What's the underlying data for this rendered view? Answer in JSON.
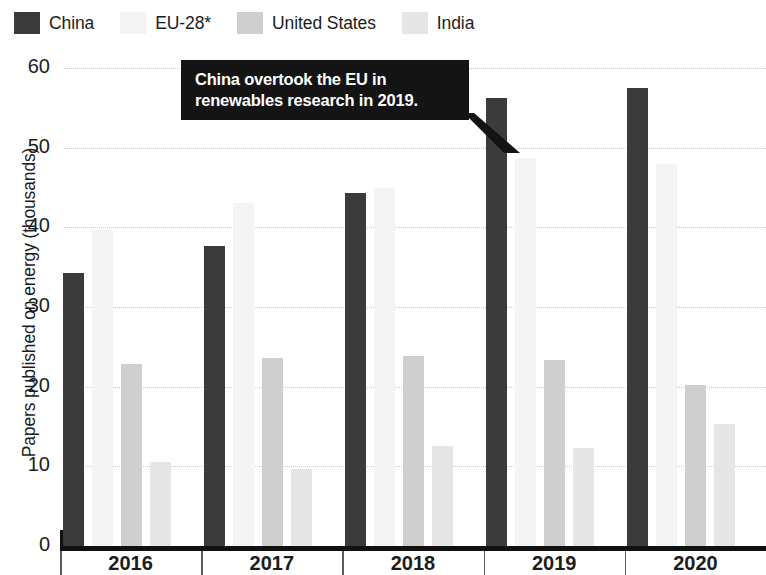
{
  "legend": {
    "entries": [
      {
        "label": "China",
        "color": "#3b3b3b",
        "key": "china"
      },
      {
        "label": "EU-28*",
        "color": "#f4f4f4",
        "key": "eu"
      },
      {
        "label": "United States",
        "color": "#cfcfcf",
        "key": "us"
      },
      {
        "label": "India",
        "color": "#e6e6e6",
        "key": "india"
      }
    ]
  },
  "annotation": {
    "text": "China overtook the EU in\nrenewables research in 2019.",
    "background": "#141414",
    "text_color": "#ffffff"
  },
  "chart_data": {
    "type": "bar",
    "title": "",
    "subtitle": "",
    "xlabel": "",
    "ylabel": "Papers published on energy (thousands)",
    "categories": [
      "2016",
      "2017",
      "2018",
      "2019",
      "2020"
    ],
    "series": [
      {
        "name": "China",
        "color": "#3b3b3b",
        "values": [
          34.3,
          37.6,
          44.3,
          56.2,
          57.5
        ]
      },
      {
        "name": "EU-28*",
        "color": "#f4f4f4",
        "values": [
          39.7,
          43.0,
          45.0,
          48.7,
          48.0
        ]
      },
      {
        "name": "United States",
        "color": "#cfcfcf",
        "values": [
          22.8,
          23.6,
          23.9,
          23.4,
          20.2
        ]
      },
      {
        "name": "India",
        "color": "#e6e6e6",
        "values": [
          10.6,
          9.7,
          12.5,
          12.3,
          15.3
        ]
      }
    ],
    "ylim": [
      0,
      60
    ],
    "yticks": [
      0,
      10,
      20,
      30,
      40,
      50,
      60
    ],
    "ytick_labels": [
      "0",
      "10",
      "20",
      "30",
      "40",
      "50",
      "60"
    ],
    "grid": true,
    "grid_style": "dotted",
    "grid_color": "#c9c9c9",
    "legend_position": "top-left",
    "annotations": [
      {
        "text": "China overtook the EU in renewables research in 2019.",
        "points_to_series": "China",
        "points_to_category": "2019"
      }
    ]
  }
}
